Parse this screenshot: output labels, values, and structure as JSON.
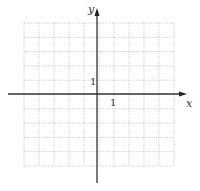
{
  "diagram": {
    "type": "coordinate-grid",
    "grid": {
      "cols": 10,
      "rows": 10,
      "left": 24,
      "right": 174,
      "top": 23,
      "bottom": 166,
      "line_color": "#b8b8b8",
      "line_style": "dotted"
    },
    "axes": {
      "color": "#333333",
      "x_axis": {
        "y": 94,
        "x_start": 8,
        "x_end": 187,
        "label": "x"
      },
      "y_axis": {
        "x": 97,
        "y_start": 183,
        "y_end": 8,
        "label": "y"
      }
    },
    "tick_labels": {
      "x_unit": "1",
      "y_unit": "1"
    }
  }
}
